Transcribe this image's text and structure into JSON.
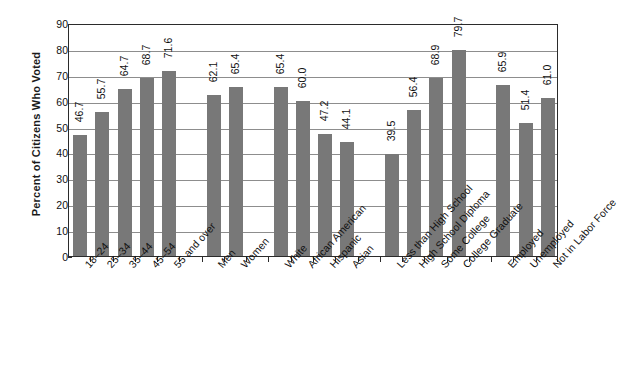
{
  "chart_data": {
    "type": "bar",
    "title": "",
    "subtitle": "",
    "xlabel": "",
    "ylabel": "Percent of Citizens Who Voted",
    "ylim": [
      0,
      90
    ],
    "ytick_step": 10,
    "yticks": [
      "0",
      "10",
      "20",
      "30",
      "40",
      "50",
      "60",
      "70",
      "80",
      "90"
    ],
    "grid": true,
    "legend": "none",
    "bar_color": "#787878",
    "axis_color": "#2b2b2b",
    "gridline_color": "#8d8d8d",
    "value_label_rotation_deg": -90,
    "x_label_rotation_deg": -48,
    "categories": [
      "18–24",
      "25–34",
      "35–44",
      "45–54",
      "55 and over",
      "Men",
      "Women",
      "White",
      "African American",
      "Hispanic",
      "Asian",
      "Less than High School",
      "High School Diploma",
      "Some College",
      "College Graduate",
      "Employed",
      "Unemployed",
      "Not in Labor Force"
    ],
    "values": [
      46.7,
      55.7,
      64.7,
      68.7,
      71.6,
      62.1,
      65.4,
      65.4,
      60.0,
      47.2,
      44.1,
      39.5,
      56.4,
      68.9,
      79.7,
      65.9,
      51.4,
      61.0
    ],
    "value_labels": [
      "46.7",
      "55.7",
      "64.7",
      "68.7",
      "71.6",
      "62.1",
      "65.4",
      "65.4",
      "60.0",
      "47.2",
      "44.1",
      "39.5",
      "56.4",
      "68.9",
      "79.7",
      "65.9",
      "51.4",
      "61.0"
    ],
    "groups": [
      {
        "name": "Age",
        "categories": [
          "18–24",
          "25–34",
          "35–44",
          "45–54",
          "55 and over"
        ]
      },
      {
        "name": "Gender",
        "categories": [
          "Men",
          "Women"
        ]
      },
      {
        "name": "Race and Ethnicity",
        "categories": [
          "White",
          "African American",
          "Hispanic",
          "Asian"
        ]
      },
      {
        "name": "Education",
        "categories": [
          "Less than High School",
          "High School Diploma",
          "Some College",
          "College Graduate"
        ]
      },
      {
        "name": "Employment Status",
        "categories": [
          "Employed",
          "Unemployed",
          "Not in Labor Force"
        ]
      }
    ]
  }
}
